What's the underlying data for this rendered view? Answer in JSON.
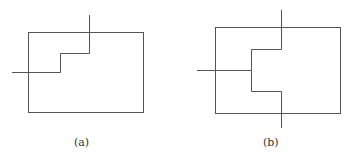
{
  "figures": [
    {
      "id": "a",
      "caption": "(a)",
      "description": "Rectangle with a single stepped line entering from the left and exiting at the top"
    },
    {
      "id": "b",
      "caption": "(b)",
      "description": "Rectangle with a branched stepped line entering from the left, splitting to exit at the top and the bottom"
    }
  ],
  "colors": {
    "stroke": "#555555",
    "background": "#ffffff"
  }
}
